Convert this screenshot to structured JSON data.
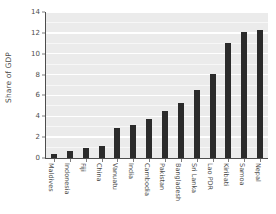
{
  "chart_data": {
    "type": "bar",
    "title": "",
    "subtitle": "",
    "xlabel": "",
    "ylabel": "Share of GDP",
    "categories": [
      "Maldives",
      "Indonesia",
      "Fiji",
      "China",
      "Vanuatu",
      "India",
      "Cambodia",
      "Pakistan",
      "Bangladesh",
      "Sri Lanka",
      "Lao PDR",
      "Kiribati",
      "Samoa",
      "Nepal"
    ],
    "values": [
      0.35,
      0.7,
      1.0,
      1.2,
      2.9,
      3.2,
      3.7,
      4.5,
      5.3,
      6.5,
      8.1,
      11.0,
      12.1,
      12.3
    ],
    "series": [
      {
        "name": "Share of GDP",
        "values": [
          0.35,
          0.7,
          1.0,
          1.2,
          2.9,
          3.2,
          3.7,
          4.5,
          5.3,
          6.5,
          8.1,
          11.0,
          12.1,
          12.3
        ]
      }
    ],
    "ylim": [
      0,
      14
    ],
    "yticks": [
      0,
      2,
      4,
      6,
      8,
      10,
      12,
      14
    ],
    "ytick_labels": [
      "0",
      "2",
      "4",
      "6",
      "8",
      "10",
      "12",
      "14"
    ],
    "grid": "horizontal-white-on-gray",
    "legend": "none",
    "bar_color": "#2b2b2b",
    "panel_color": "#ebebeb",
    "gridline_color": "#ffffff",
    "axis_color": "#4d4d4d",
    "x_label_rotation": "90"
  }
}
